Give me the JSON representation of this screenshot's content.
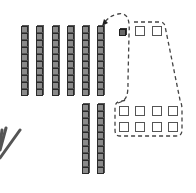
{
  "diagram": {
    "type": "base-ten-blocks",
    "top_rods": {
      "count": 6,
      "cubes_per_rod": 10,
      "x": [
        21,
        36,
        52,
        67,
        82,
        97
      ],
      "y": 26
    },
    "bottom_rods": {
      "count": 2,
      "cubes_per_rod": 10,
      "x": [
        82,
        97
      ],
      "y": 104
    },
    "ones": {
      "filled": [
        {
          "x": 119,
          "y": 29
        }
      ],
      "empty": [
        {
          "x": 135,
          "y": 26
        },
        {
          "x": 152,
          "y": 26
        },
        {
          "x": 119,
          "y": 106
        },
        {
          "x": 135,
          "y": 106
        },
        {
          "x": 152,
          "y": 106
        },
        {
          "x": 168,
          "y": 106
        },
        {
          "x": 119,
          "y": 122
        },
        {
          "x": 135,
          "y": 122
        },
        {
          "x": 152,
          "y": 122
        },
        {
          "x": 168,
          "y": 122
        }
      ]
    },
    "arrow": {
      "style": "dashed",
      "direction": "toward top rods"
    },
    "group_outline": {
      "style": "dashed",
      "encloses": "10 ones"
    },
    "colors": {
      "cube_fill": "#8a8a8a",
      "cube_edge": "#2a2a2a",
      "dashed_line": "#444444",
      "background": "#ffffff"
    }
  }
}
